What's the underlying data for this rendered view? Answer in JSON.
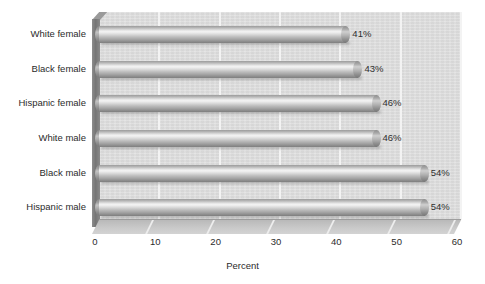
{
  "chart_data": {
    "type": "bar",
    "orientation": "horizontal",
    "title": "",
    "subtitle": "",
    "xlabel": "Percent",
    "ylabel": "",
    "categories": [
      "White female",
      "Black female",
      "Hispanic female",
      "White male",
      "Black male",
      "Hispanic male"
    ],
    "values": [
      41,
      43,
      46,
      46,
      54,
      54
    ],
    "data_labels": [
      "41%",
      "43%",
      "46%",
      "46%",
      "54%",
      "54%"
    ],
    "xlim": [
      0,
      60
    ],
    "xticks": [
      0,
      10,
      20,
      30,
      40,
      50,
      60
    ],
    "xtick_labels": [
      "0",
      "10",
      "20",
      "30",
      "40",
      "50",
      "60"
    ],
    "grid": "vertical",
    "legend": "none",
    "style": "3d-cylinder",
    "colors": {
      "plot_background": "#dcdcdc",
      "gridline": "#f3f3f3",
      "bar_light": "#f4f4f4",
      "bar_dark": "#7e7e7e",
      "side_wall": "#757575",
      "floor": "#c9c9c9",
      "text": "#2b2b2b"
    }
  }
}
